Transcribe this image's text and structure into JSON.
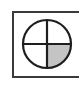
{
  "icon": {
    "name": "quarter-filled-circle-crosshair",
    "frame_color": "#3a3a3a",
    "stroke_color": "#1e1e1e",
    "fill_color": "#c4c4c4",
    "background": "#ffffff",
    "filled_quadrant": "bottom-right"
  }
}
